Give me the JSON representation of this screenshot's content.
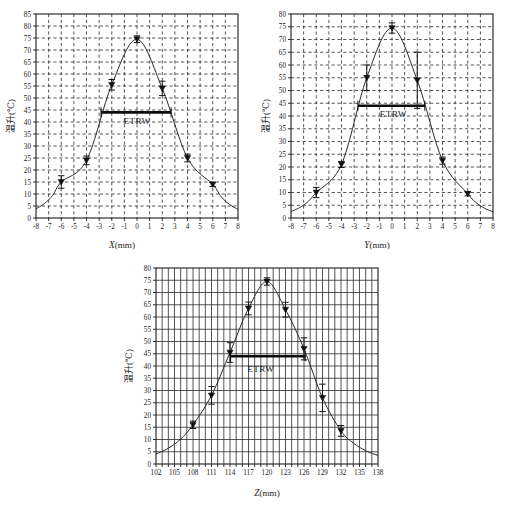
{
  "figure": {
    "title": "",
    "panel_count": 3,
    "background": "#ffffff",
    "ink_color": "#1a1a1a"
  },
  "labels": {
    "etrw": "ETRW",
    "y_axis_cjk": "温升(℃)",
    "x_axis_x": "(mm)",
    "x_axis_x_sym": "X",
    "x_axis_y": "(mm)",
    "x_axis_y_sym": "Y",
    "x_axis_z": "(mm)",
    "x_axis_z_sym": "Z"
  },
  "chart_data": [
    {
      "id": "panel-x",
      "type": "line",
      "title": "",
      "xlabel": "X(mm)",
      "ylabel": "温升(℃)",
      "xlim": [
        -8,
        8
      ],
      "ylim": [
        0,
        85
      ],
      "xtick_step": 1,
      "ytick_step": 5,
      "grid": "dashed",
      "xticklabels": [
        "-8",
        "-7",
        "-6",
        "-5",
        "-4",
        "-3",
        "-2",
        "-1",
        "0",
        "1",
        "2",
        "3",
        "4",
        "5",
        "6",
        "7",
        "8"
      ],
      "yticklabels": [
        "0",
        "5",
        "10",
        "15",
        "20",
        "25",
        "30",
        "35",
        "40",
        "45",
        "50",
        "55",
        "60",
        "65",
        "70",
        "75",
        "80",
        "85"
      ],
      "x": [
        -6,
        -4,
        -2,
        0,
        2,
        4,
        6
      ],
      "values": [
        15.0,
        24.0,
        55.5,
        74.5,
        54.0,
        25.0,
        14.0
      ],
      "yerr": [
        2.6,
        1.8,
        2.2,
        1.4,
        3.0,
        1.6,
        0.9
      ],
      "annotation": {
        "label": "ETRW",
        "level": 44.0,
        "x_start": -2.85,
        "x_end": 2.7,
        "label_x": 0.0,
        "label_y": 39.0
      }
    },
    {
      "id": "panel-y",
      "type": "line",
      "title": "",
      "xlabel": "Y(mm)",
      "ylabel": "温升(℃)",
      "xlim": [
        -8,
        8
      ],
      "ylim": [
        0,
        80
      ],
      "xtick_step": 1,
      "ytick_step": 5,
      "grid": "dashed",
      "xticklabels": [
        "-8",
        "-7",
        "-6",
        "-5",
        "-4",
        "-3",
        "-2",
        "-1",
        "0",
        "1",
        "2",
        "3",
        "4",
        "5",
        "6",
        "7",
        "8"
      ],
      "yticklabels": [
        "0",
        "5",
        "10",
        "15",
        "20",
        "25",
        "30",
        "35",
        "40",
        "45",
        "50",
        "55",
        "60",
        "65",
        "70",
        "75",
        "80"
      ],
      "x": [
        -6,
        -4,
        -2,
        0,
        2,
        4,
        6
      ],
      "values": [
        10.0,
        21.0,
        55.0,
        74.5,
        54.0,
        22.5,
        9.5
      ],
      "yerr": [
        2.0,
        1.2,
        5.0,
        2.0,
        11.0,
        1.4,
        0.8
      ],
      "annotation": {
        "label": "ETRW",
        "level": 44.0,
        "x_start": -2.7,
        "x_end": 2.6,
        "label_x": 0.1,
        "label_y": 39.5
      }
    },
    {
      "id": "panel-z",
      "type": "line",
      "title": "",
      "xlabel": "Z(mm)",
      "ylabel": "温升(℃)",
      "xlim": [
        102,
        138
      ],
      "ylim": [
        0,
        80
      ],
      "xtick_step": 1,
      "xtick_label_step": 3,
      "ytick_step": 5,
      "grid": "solid",
      "xticklabels": [
        "102",
        "105",
        "108",
        "111",
        "114",
        "117",
        "120",
        "123",
        "126",
        "129",
        "132",
        "135",
        "138"
      ],
      "yticklabels": [
        "0",
        "5",
        "10",
        "15",
        "20",
        "25",
        "30",
        "35",
        "40",
        "45",
        "50",
        "55",
        "60",
        "65",
        "70",
        "75",
        "80"
      ],
      "x": [
        108,
        111,
        114,
        117,
        120,
        123,
        126,
        129,
        132
      ],
      "values": [
        16.0,
        28.0,
        45.5,
        63.5,
        74.5,
        63.0,
        47.0,
        27.0,
        13.5
      ],
      "yerr": [
        1.5,
        3.6,
        4.0,
        2.6,
        1.5,
        3.0,
        4.5,
        5.6,
        2.2
      ],
      "annotation": {
        "label": "ETRW",
        "level": 44.0,
        "x_start": 114.1,
        "x_end": 126.2,
        "label_x": 119.0,
        "label_y": 37.5
      }
    }
  ]
}
